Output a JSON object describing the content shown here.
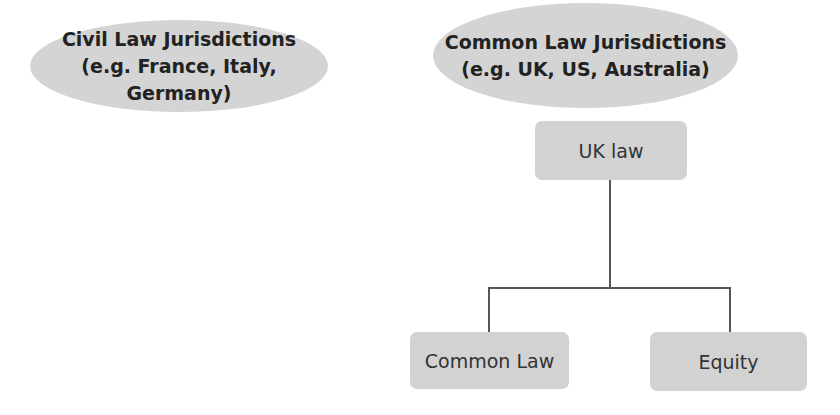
{
  "diagram": {
    "civil": {
      "line1": "Civil Law Jurisdictions",
      "line2": "(e.g. France, Italy, Germany)"
    },
    "common": {
      "line1": "Common Law Jurisdictions",
      "line2": "(e.g. UK, US, Australia)"
    },
    "root": "UK law",
    "children": [
      "Common Law",
      "Equity"
    ],
    "colors": {
      "fill": "#d3d3d3",
      "line": "#555555",
      "text": "#222222"
    }
  }
}
